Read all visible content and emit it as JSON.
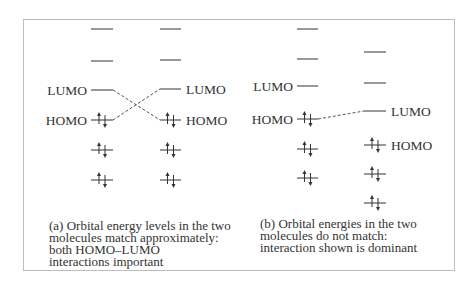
{
  "panels": [
    {
      "id": "a",
      "caption_lines": [
        "(a)  Orbital energy levels in the two",
        "molecules match approximately:",
        "both HOMO–LUMO",
        "interactions important"
      ],
      "columns": [
        {
          "x1": 91,
          "x2": 113,
          "levels": [
            {
              "y": 29,
              "occupied": false,
              "label": ""
            },
            {
              "y": 61,
              "occupied": false,
              "label": ""
            },
            {
              "y": 90,
              "occupied": false,
              "label": "LUMO",
              "label_side": "left"
            },
            {
              "y": 120,
              "occupied": true,
              "label": "HOMO",
              "label_side": "left"
            },
            {
              "y": 150,
              "occupied": true,
              "label": ""
            },
            {
              "y": 180,
              "occupied": true,
              "label": ""
            }
          ]
        },
        {
          "x1": 160,
          "x2": 181,
          "levels": [
            {
              "y": 29,
              "occupied": false,
              "label": ""
            },
            {
              "y": 60,
              "occupied": false,
              "label": ""
            },
            {
              "y": 89,
              "occupied": false,
              "label": "LUMO",
              "label_side": "right"
            },
            {
              "y": 120,
              "occupied": true,
              "label": "HOMO",
              "label_side": "right"
            },
            {
              "y": 150,
              "occupied": true,
              "label": ""
            },
            {
              "y": 180,
              "occupied": true,
              "label": ""
            }
          ]
        }
      ],
      "interactions": [
        {
          "from": "LUMO-left",
          "to": "HOMO-right",
          "style": "dashed"
        },
        {
          "from": "HOMO-left",
          "to": "LUMO-right",
          "style": "dashed"
        }
      ]
    },
    {
      "id": "b",
      "caption_lines": [
        "(b)  Orbital energies in the two",
        "molecules do not match:",
        "interaction shown is dominant"
      ],
      "columns": [
        {
          "x1": 297,
          "x2": 318,
          "levels": [
            {
              "y": 29,
              "occupied": false,
              "label": ""
            },
            {
              "y": 59,
              "occupied": false,
              "label": ""
            },
            {
              "y": 86,
              "occupied": false,
              "label": "LUMO",
              "label_side": "left"
            },
            {
              "y": 119,
              "occupied": true,
              "label": "HOMO",
              "label_side": "left"
            },
            {
              "y": 149,
              "occupied": true,
              "label": ""
            },
            {
              "y": 178,
              "occupied": true,
              "label": ""
            }
          ]
        },
        {
          "x1": 364,
          "x2": 386,
          "levels": [
            {
              "y": 52,
              "occupied": false,
              "label": ""
            },
            {
              "y": 83,
              "occupied": false,
              "label": ""
            },
            {
              "y": 111,
              "occupied": false,
              "label": "LUMO",
              "label_side": "right"
            },
            {
              "y": 145,
              "occupied": true,
              "label": "HOMO",
              "label_side": "right"
            },
            {
              "y": 174,
              "occupied": true,
              "label": ""
            },
            {
              "y": 203,
              "occupied": true,
              "label": ""
            }
          ]
        }
      ],
      "interactions": [
        {
          "from": "HOMO-left",
          "to": "LUMO-right",
          "style": "dashed"
        }
      ]
    }
  ],
  "colors": {
    "line": "#333333",
    "dash": "#555555",
    "border": "#bdbdbd"
  }
}
